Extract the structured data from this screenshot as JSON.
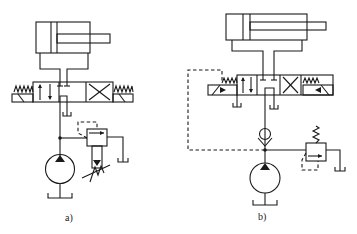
{
  "figure": {
    "subfigures": [
      {
        "label": "a)",
        "components": [
          "double-acting cylinder",
          "4/3 spring-centered directional valve",
          "hydraulic pump",
          "pilot-operated relief valve with adjustable spring",
          "tank returns"
        ]
      },
      {
        "label": "b)",
        "components": [
          "double-acting cylinder",
          "4/3 solenoid directional valve with pilot line",
          "check valve",
          "hydraulic pump",
          "relief valve with spring",
          "tank returns"
        ]
      }
    ]
  },
  "colors": {
    "stroke": "#1a1a1a",
    "background": "#ffffff"
  }
}
